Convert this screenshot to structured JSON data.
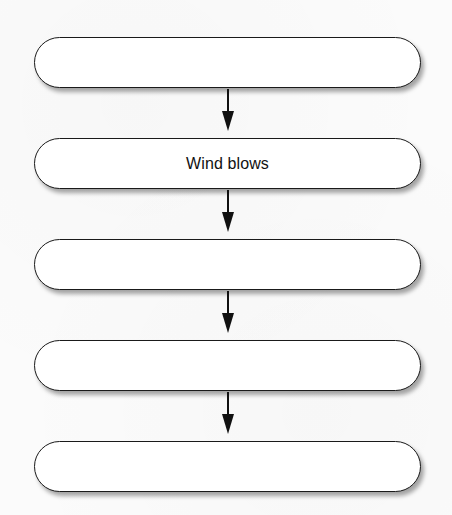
{
  "diagram": {
    "type": "vertical-flowchart",
    "colors": {
      "box_border": "#1a1a1a",
      "box_fill": "#ffffff",
      "arrow": "#111111",
      "background": "#fbfbfb",
      "text": "#111111"
    },
    "steps": [
      {
        "label": ""
      },
      {
        "label": "Wind blows"
      },
      {
        "label": ""
      },
      {
        "label": ""
      },
      {
        "label": ""
      }
    ],
    "arrows": [
      {
        "from": 0,
        "to": 1,
        "icon": "arrow-down-icon"
      },
      {
        "from": 1,
        "to": 2,
        "icon": "arrow-down-icon"
      },
      {
        "from": 2,
        "to": 3,
        "icon": "arrow-down-icon"
      },
      {
        "from": 3,
        "to": 4,
        "icon": "arrow-down-icon"
      }
    ]
  }
}
